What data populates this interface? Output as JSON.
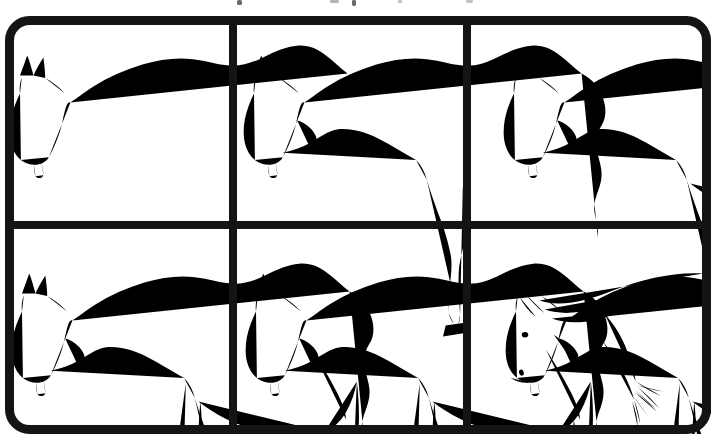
{
  "document": {
    "title": "How to Draw a Horse",
    "kind": "step-by-step drawing tutorial",
    "subject": "horse",
    "pose": "grazing / head lowered",
    "style": "black line art on white",
    "layout": {
      "columns": 3,
      "rows": 2,
      "panel_count": 6
    },
    "frame": {
      "stroke_color": "#141414",
      "stroke_width_px": 9,
      "corner_radius_px": 20,
      "background_color": "#ffffff"
    },
    "ink_color": "#1a1a1a",
    "line_width_px": 1.6
  },
  "panels": [
    {
      "number": "1",
      "name": "panel-step-1",
      "caption": "Step 1",
      "description": "Head outline with two ears, muzzle, jaw line, and the long sweeping topline curve of neck and back.",
      "elements": [
        "ears",
        "head-outline",
        "muzzle",
        "jaw-line",
        "topline-curve"
      ]
    },
    {
      "number": "2",
      "name": "panel-step-2",
      "caption": "Step 2",
      "description": "Neck underline, chest, shoulder and the first front leg with hoof; rear contour of hindquarters added.",
      "elements": [
        "neck-underline",
        "chest",
        "shoulder-line",
        "front-leg-1",
        "hoof",
        "hindquarter-contour"
      ]
    },
    {
      "number": "3",
      "name": "panel-step-3",
      "caption": "Step 3",
      "description": "Belly line closed and the first hind leg with hock and hoof completes the body silhouette.",
      "elements": [
        "belly-line",
        "hind-leg-1",
        "hock",
        "hoof",
        "haunch-curve"
      ]
    },
    {
      "number": "4",
      "name": "panel-step-4",
      "caption": "Step 4",
      "description": "Second front leg added, raised and bent at the knee, stepping forward.",
      "elements": [
        "front-leg-2-raised",
        "knee-bend",
        "hoof",
        "forearm-muscle-line"
      ]
    },
    {
      "number": "5",
      "name": "panel-step-5",
      "caption": "Step 5",
      "description": "Tail drawn flowing from the rump with hair strands, plus the second hind leg standing beside the first.",
      "elements": [
        "tail",
        "tail-hair-strands",
        "hind-leg-2",
        "hoof"
      ]
    },
    {
      "number": "6",
      "name": "panel-step-6",
      "caption": "Step 6",
      "description": "Finished drawing: mane laid along the crest of the neck, eye, nostril and mouth details on the head.",
      "elements": [
        "mane",
        "forelock",
        "eye",
        "nostril",
        "mouth-line",
        "cheek-line"
      ]
    }
  ],
  "top_artifacts": {
    "description": "faint cropped ink marks from a cut-off caption line above the frame",
    "marks": 5
  }
}
